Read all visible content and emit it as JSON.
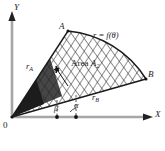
{
  "figure": {
    "background_color": "#ffffff",
    "axis_color": "#9a9a9a",
    "ink_color": "#1a1a1a",
    "hatch_color": "#2b2b2b"
  },
  "axes": {
    "y_label": "Y",
    "x_label": "X",
    "origin_label": "0"
  },
  "points": {
    "a_label": "A",
    "b_label": "B"
  },
  "labels": {
    "curve": "r = f(θ)",
    "area_word": "Area",
    "area_name": "A",
    "area_sub": "2",
    "r_a": "r",
    "r_a_sub": "A",
    "r_b": "r",
    "r_b_sub": "B",
    "alpha": "α",
    "beta": "β"
  },
  "geometry": {
    "origin": [
      12,
      117
    ],
    "point_a": [
      68,
      31
    ],
    "point_b": [
      146,
      79
    ],
    "x_axis_end": [
      152,
      117
    ],
    "y_axis_top": [
      12,
      14
    ],
    "angle_alpha_deg": 27,
    "angle_beta_deg": 57,
    "tick_alpha_x": 76,
    "tick_beta_x": 57
  }
}
